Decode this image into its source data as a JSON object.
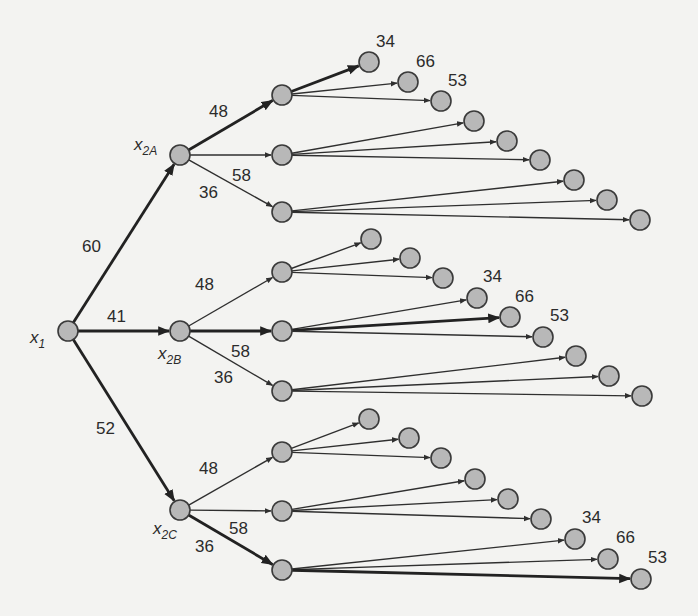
{
  "diagram": {
    "type": "decision-tree",
    "root": {
      "label": "x",
      "sub": "1"
    },
    "stage2": [
      {
        "label": "x",
        "sub": "2A",
        "edge_value": "60"
      },
      {
        "label": "x",
        "sub": "2B",
        "edge_value": "41"
      },
      {
        "label": "x",
        "sub": "2C",
        "edge_value": "52"
      }
    ],
    "stage3_edge_values": [
      "48",
      "58",
      "36"
    ],
    "leaf_values": [
      "34",
      "66",
      "53"
    ],
    "highlighted_paths": [
      {
        "path": [
          "x1",
          "x2A",
          "48",
          "34"
        ]
      },
      {
        "path": [
          "x1",
          "x2B",
          "58",
          "66"
        ]
      },
      {
        "path": [
          "x1",
          "x2C",
          "36",
          "53"
        ]
      }
    ],
    "colors": {
      "background": "#f3f3f1",
      "node_fill": "#b8b8b8",
      "node_stroke": "#3a3a3a",
      "edge": "#2f2f2f"
    }
  }
}
